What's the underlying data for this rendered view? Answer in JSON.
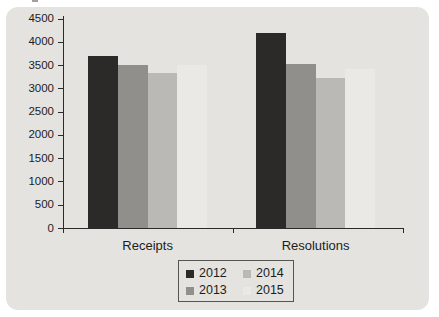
{
  "chart_data": {
    "type": "bar",
    "title": "",
    "categories": [
      "Receipts",
      "Resolutions"
    ],
    "series": [
      {
        "name": "2012",
        "color": "#2b2a28",
        "values": [
          3700,
          4200
        ]
      },
      {
        "name": "2013",
        "color": "#908f8c",
        "values": [
          3500,
          3525
        ]
      },
      {
        "name": "2014",
        "color": "#bbb9b6",
        "values": [
          3325,
          3225
        ]
      },
      {
        "name": "2015",
        "color": "#eae9e6",
        "values": [
          3500,
          3425
        ]
      }
    ],
    "ylim": [
      0,
      4500
    ],
    "y_tick_step": 500,
    "y_tick_labels": [
      "0",
      "500",
      "1000",
      "1500",
      "2000",
      "2500",
      "3000",
      "3500",
      "4000",
      "4500"
    ],
    "xlabel": "",
    "ylabel": "",
    "grid": false,
    "legend_position": "bottom",
    "legend_layout": "2-columns: [2012,2013] [2014,2015]"
  },
  "colors": {
    "page_bg": "#ffffff",
    "panel_bg": "#e4e3e0",
    "axis": "#2b2b29",
    "text": "#1d1d1b",
    "legend_border": "#55544f",
    "legend_bg": "#e4e3e0",
    "artifact": "#a0a09e"
  }
}
